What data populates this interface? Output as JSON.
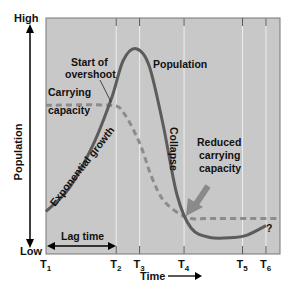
{
  "chart_data": {
    "type": "line",
    "title": "",
    "xlabel": "Time",
    "ylabel": "Population",
    "y_axis_high_label": "High",
    "y_axis_low_label": "Low",
    "x_ticks": [
      "T1",
      "T2",
      "T3",
      "T4",
      "T5",
      "T6"
    ],
    "x_tick_positions": [
      0,
      0.3,
      0.4,
      0.59,
      0.84,
      0.94
    ],
    "ylim": [
      0,
      1
    ],
    "grid": "vertical lines at T2–T6",
    "series": [
      {
        "name": "Population",
        "style": "solid",
        "points": [
          [
            0,
            0.18
          ],
          [
            0.1,
            0.28
          ],
          [
            0.2,
            0.46
          ],
          [
            0.28,
            0.66
          ],
          [
            0.33,
            0.82
          ],
          [
            0.385,
            0.87
          ],
          [
            0.44,
            0.8
          ],
          [
            0.5,
            0.55
          ],
          [
            0.56,
            0.25
          ],
          [
            0.62,
            0.11
          ],
          [
            0.7,
            0.07
          ],
          [
            0.8,
            0.07
          ],
          [
            0.86,
            0.08
          ],
          [
            0.94,
            0.12
          ]
        ]
      },
      {
        "name": "Carrying capacity",
        "style": "dashed",
        "points": [
          [
            0,
            0.63
          ],
          [
            0.27,
            0.63
          ],
          [
            0.33,
            0.6
          ],
          [
            0.4,
            0.47
          ],
          [
            0.45,
            0.33
          ],
          [
            0.5,
            0.23
          ],
          [
            0.57,
            0.17
          ],
          [
            0.62,
            0.15
          ],
          [
            0.7,
            0.15
          ],
          [
            0.99,
            0.15
          ]
        ]
      }
    ],
    "annotations": {
      "start_of_overshoot": [
        "Start of",
        "overshoot"
      ],
      "population": "Population",
      "carrying_capacity": [
        "Carrying",
        "capacity"
      ],
      "exponential_growth": "Exponential growth",
      "collapse": "Collapse",
      "reduced_carrying_capacity": [
        "Reduced",
        "carrying",
        "capacity"
      ],
      "lag_time": "Lag time",
      "question": "?"
    },
    "colors": {
      "plot_background": "#c8c8c8",
      "population_line": "#5c5c5c",
      "carrying_capacity_line": "#8c8c8c",
      "grid_line": "#eeeeee",
      "arrow": "#8a8a8a"
    }
  }
}
